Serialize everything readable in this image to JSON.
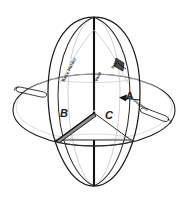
{
  "figure": {
    "background_color": "#ffffff",
    "line_color": "#1a1a1a",
    "faint_line_color": "#b4b4b4",
    "shade_color": "#9a9a9a",
    "compartments": [
      {
        "id": "A",
        "label": "A"
      },
      {
        "id": "B",
        "label": "B"
      },
      {
        "id": "C",
        "label": "C"
      }
    ],
    "annotations": [
      {
        "id": "left-upper",
        "label": "Base Holder",
        "rotation": -62
      },
      {
        "id": "center-upper",
        "label": "Vane",
        "rotation": -66
      },
      {
        "id": "right-upper",
        "label": "Inlet",
        "rotation": -52
      },
      {
        "id": "right-lower",
        "label": "Support",
        "rotation": 36
      }
    ],
    "callouts": [
      {
        "id": "arrow-a",
        "label": "A",
        "direction": "left"
      }
    ],
    "parts": [
      {
        "id": "outer-shell",
        "name": "outer shell"
      },
      {
        "id": "equator-ring",
        "name": "equatorial ring"
      },
      {
        "id": "meridian-line",
        "name": "vertical meridian"
      },
      {
        "id": "left-handle",
        "name": "left handle loop"
      },
      {
        "id": "right-handle",
        "name": "right handle loop"
      },
      {
        "id": "partition-b",
        "name": "partition wall B"
      },
      {
        "id": "partition-c",
        "name": "partition wall C"
      }
    ]
  }
}
